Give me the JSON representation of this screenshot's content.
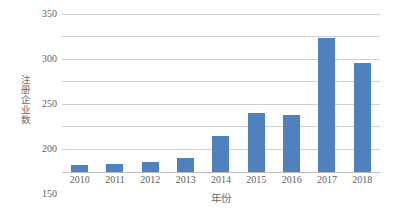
{
  "chart_data": {
    "type": "bar",
    "title": "",
    "subtitle": "",
    "xlabel": "年份",
    "ylabel": "注册企业数",
    "categories": [
      "2010",
      "2011",
      "2012",
      "2013",
      "2014",
      "2015",
      "2016",
      "2017",
      "2018"
    ],
    "values": [
      16,
      17,
      22,
      30,
      80,
      130,
      127,
      297,
      242
    ],
    "series": [
      {
        "name": "注册企业数",
        "values": [
          16,
          17,
          22,
          30,
          80,
          130,
          127,
          297,
          242
        ]
      }
    ],
    "ylim": [
      0,
      350
    ],
    "ytick_step": 50,
    "yticks": [
      0,
      50,
      100,
      150,
      200,
      250,
      300,
      350
    ],
    "ytick_labels": [
      "0",
      "50",
      "100",
      "150",
      "200",
      "250",
      "300",
      "350"
    ],
    "grid": true,
    "grid_axis": "y",
    "legend": false,
    "legend_position": "none",
    "bar_color": "#4e81bd",
    "gridline_color": "#d0d0d0",
    "axis_color": "#bcbcbc",
    "background_color": "#ffffff",
    "text_color": "#5f5f5f"
  }
}
